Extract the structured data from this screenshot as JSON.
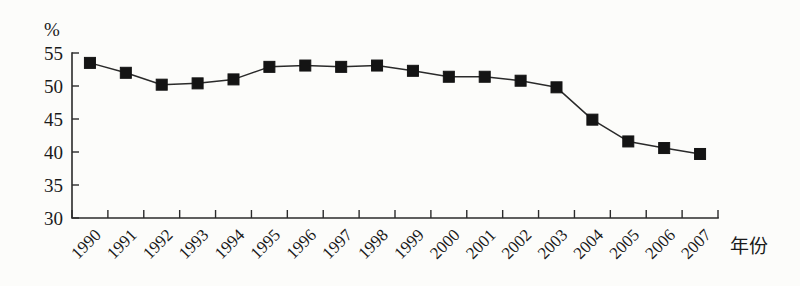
{
  "chart_data": {
    "type": "line",
    "title": "",
    "xlabel": "年份",
    "ylabel": "%",
    "x": [
      1990,
      1991,
      1992,
      1993,
      1994,
      1995,
      1996,
      1997,
      1998,
      1999,
      2000,
      2001,
      2002,
      2003,
      2004,
      2005,
      2006,
      2007
    ],
    "categories": [
      "1990",
      "1991",
      "1992",
      "1993",
      "1994",
      "1995",
      "1996",
      "1997",
      "1998",
      "1999",
      "2000",
      "2001",
      "2002",
      "2003",
      "2004",
      "2005",
      "2006",
      "2007"
    ],
    "values": [
      53.5,
      52.0,
      50.2,
      50.4,
      51.0,
      52.9,
      53.1,
      52.9,
      53.1,
      52.3,
      51.4,
      51.4,
      50.8,
      49.8,
      44.9,
      41.6,
      40.6,
      39.7
    ],
    "ylim": [
      30,
      55
    ],
    "yticks": [
      30,
      35,
      40,
      45,
      50,
      55
    ],
    "ytick_labels": [
      "30",
      "35",
      "40",
      "45",
      "50",
      "55"
    ],
    "grid": false,
    "legend": null,
    "marker": "filled-square",
    "line_color": "#2a2a2a",
    "marker_color": "#141414",
    "background_color": "#fcfcfa",
    "xtick_rotation_deg": -45
  },
  "figure": {
    "unit_label": "%",
    "axis_title_x": "年份"
  }
}
